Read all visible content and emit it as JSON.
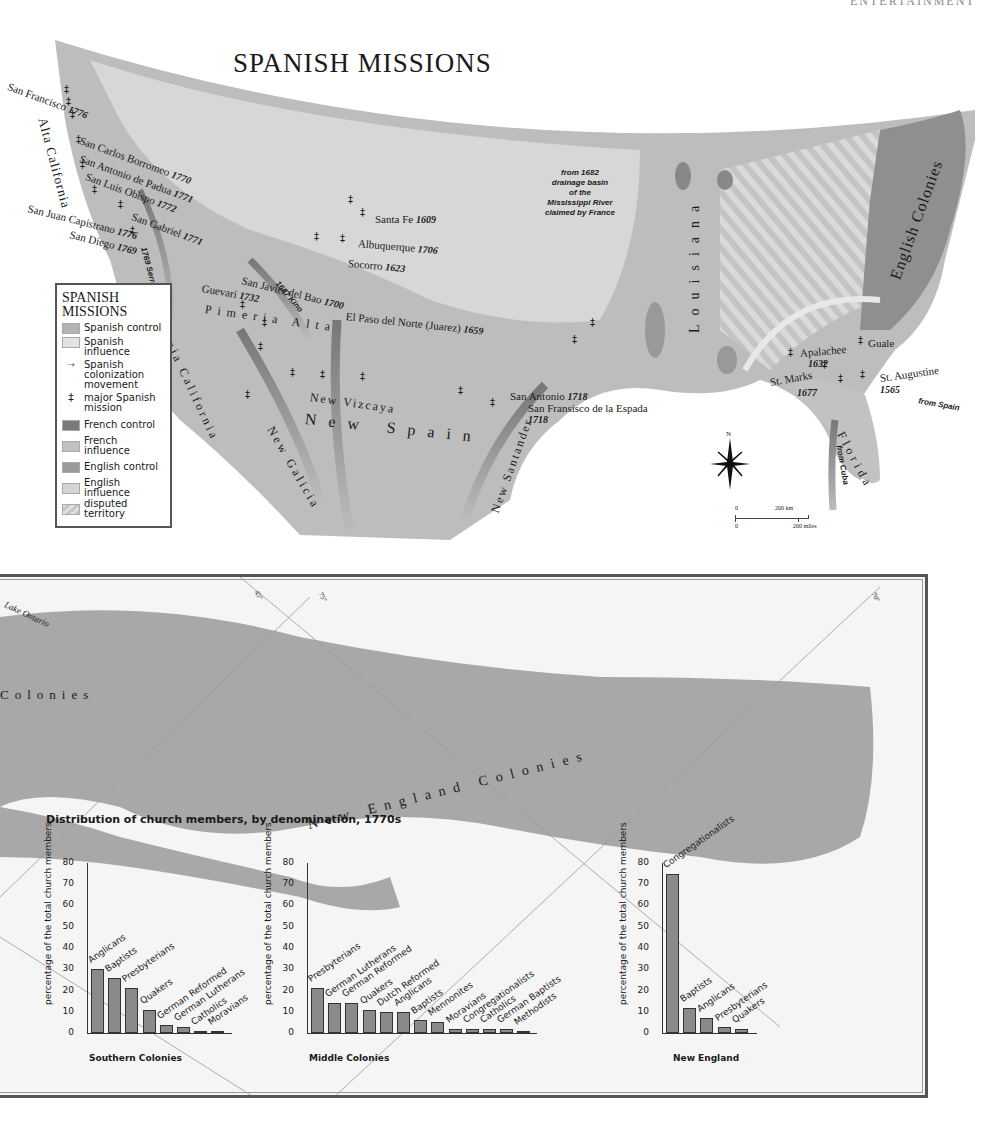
{
  "page": {
    "running_head": "ENTERTAINMENT",
    "map_title": "SPANISH MISSIONS"
  },
  "legend": {
    "title_line1": "SPANISH",
    "title_line2": "MISSIONS",
    "items": [
      {
        "label": "Spanish control",
        "color": "#b3b3b3"
      },
      {
        "label": "Spanish influence",
        "color": "#e2e2e2"
      },
      {
        "label": "Spanish colonization movement",
        "icon": "arrow-icon"
      },
      {
        "label": "major Spanish mission",
        "icon": "mission-cross-icon"
      },
      {
        "label": "French control",
        "color": "#7a7a7a"
      },
      {
        "label": "French influence",
        "color": "#c2c2c2"
      },
      {
        "label": "English control",
        "color": "#9a9a9a"
      },
      {
        "label": "English influence",
        "color": "#d4d4d4"
      },
      {
        "label": "disputed territory",
        "color": "#cfcfcf",
        "pattern": "stripes"
      }
    ]
  },
  "map": {
    "regions": {
      "alta_california": "Alta California",
      "baja_california": "Baja California",
      "pimeria_alta": "Pimeria Alta",
      "new_vizcaya": "New Vizcaya",
      "new_spain": "New Spain",
      "new_galicia": "New Galicia",
      "new_santander": "New Santander",
      "louisiana": "Louisiana",
      "english_colonies": "English Colonies",
      "florida": "Florida"
    },
    "missions": [
      {
        "name": "San Francisco",
        "year": "1776"
      },
      {
        "name": "San Carlos Borromeo",
        "year": "1770"
      },
      {
        "name": "San Antonio de Padua",
        "year": "1771"
      },
      {
        "name": "San Luis Obispo",
        "year": "1772"
      },
      {
        "name": "San Gabriel",
        "year": "1771"
      },
      {
        "name": "San Juan Capistrano",
        "year": "1776"
      },
      {
        "name": "San Diego",
        "year": "1769"
      },
      {
        "name": "Santa Fe",
        "year": "1609"
      },
      {
        "name": "Albuquerque",
        "year": "1706"
      },
      {
        "name": "Socorro",
        "year": "1623"
      },
      {
        "name": "San Javier del Bao",
        "year": "1700"
      },
      {
        "name": "Guevari",
        "year": "1732"
      },
      {
        "name": "El Paso del Norte (Juarez)",
        "year": "1659"
      },
      {
        "name": "San Antonio",
        "year": "1718"
      },
      {
        "name": "San Fransisco de la Espada",
        "year": "1718"
      },
      {
        "name": "Apalachee",
        "year": "1632"
      },
      {
        "name": "St. Marks",
        "year": "1677"
      },
      {
        "name": "Guale",
        "year": ""
      },
      {
        "name": "St. Augustine",
        "year": "1565"
      }
    ],
    "routes": {
      "serra": "1769 Serra",
      "kino": "1687 Kino",
      "from_spain": "from Spain",
      "from_cuba": "from Cuba"
    },
    "france_note": [
      "from 1682",
      "drainage basin",
      "of the",
      "Mississippi River",
      "claimed by France"
    ],
    "compass": "N",
    "scale": {
      "km_zero": "0",
      "km_label": "200 km",
      "mi_zero": "0",
      "mi_label": "200 miles"
    }
  },
  "bottom_map": {
    "lake": "Lake Ontario",
    "grid": [
      "45°",
      "75°",
      "70°"
    ],
    "colonies_left": "Colonies",
    "new_england": "New England Colonies"
  },
  "charts_title": "Distribution of church members, by denomination, 1770s",
  "chart_data": [
    {
      "type": "bar",
      "title": "Southern Colonies",
      "xlabel": "",
      "ylabel": "percentage of the total church members",
      "ylim": [
        0,
        80
      ],
      "yticks": [
        0,
        10,
        20,
        30,
        40,
        50,
        60,
        70,
        80
      ],
      "categories": [
        "Anglicans",
        "Baptists",
        "Presbyterians",
        "Quakers",
        "German Reformed",
        "German Lutherans",
        "Catholics",
        "Moravians"
      ],
      "values": [
        30,
        26,
        21,
        11,
        4,
        3,
        1,
        1
      ]
    },
    {
      "type": "bar",
      "title": "Middle Colonies",
      "xlabel": "",
      "ylabel": "percentage of the total church members",
      "ylim": [
        0,
        80
      ],
      "yticks": [
        0,
        10,
        20,
        30,
        40,
        50,
        60,
        70,
        80
      ],
      "categories": [
        "Presbyterians",
        "German Lutherans",
        "German Reformed",
        "Quakers",
        "Dutch Reformed",
        "Anglicans",
        "Baptists",
        "Mennonites",
        "Moravians",
        "Congregationalists",
        "Catholics",
        "German Baptists",
        "Methodists"
      ],
      "values": [
        21,
        14,
        14,
        11,
        10,
        10,
        6,
        5,
        2,
        2,
        2,
        2,
        1
      ]
    },
    {
      "type": "bar",
      "title": "New England",
      "xlabel": "",
      "ylabel": "percentage of the total church members",
      "ylim": [
        0,
        80
      ],
      "yticks": [
        0,
        10,
        20,
        30,
        40,
        50,
        60,
        70,
        80
      ],
      "categories": [
        "Congregationalists",
        "Baptists",
        "Anglicans",
        "Presbyterians",
        "Quakers"
      ],
      "values": [
        75,
        12,
        7,
        3,
        2
      ]
    }
  ]
}
